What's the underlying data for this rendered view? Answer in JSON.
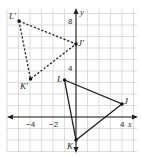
{
  "figure": {
    "type": "coordinate-plane-transformation",
    "axes": {
      "x_label": "x",
      "y_label": "y",
      "x_ticks": [
        {
          "value": -4,
          "label": "−4"
        },
        {
          "value": -2,
          "label": "−2"
        },
        {
          "value": 4,
          "label": "4"
        }
      ],
      "y_ticks": [
        {
          "value": 8,
          "label": "8"
        },
        {
          "value": 4,
          "label": "4"
        }
      ],
      "x_range": [
        -6,
        5
      ],
      "y_range": [
        -3,
        9
      ],
      "grid": true
    },
    "triangles": [
      {
        "name": "JKL",
        "style": "solid",
        "vertices": [
          {
            "name": "J",
            "label": "J",
            "x": 4,
            "y": 1
          },
          {
            "name": "K",
            "label": "K",
            "x": 0,
            "y": -2
          },
          {
            "name": "L",
            "label": "L",
            "x": -1,
            "y": 3
          }
        ]
      },
      {
        "name": "J'K'L'",
        "style": "dashed",
        "vertices": [
          {
            "name": "J'",
            "label": "J′",
            "x": 0,
            "y": 6
          },
          {
            "name": "K'",
            "label": "K′",
            "x": -4,
            "y": 3
          },
          {
            "name": "L'",
            "label": "L′",
            "x": -5,
            "y": 8
          }
        ]
      }
    ],
    "colors": {
      "grid": "#c8c8c8",
      "ink": "#222222",
      "background": "#ffffff"
    }
  }
}
